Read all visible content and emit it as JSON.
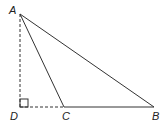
{
  "diagram": {
    "type": "geometry-triangle",
    "points": {
      "A": {
        "label": "A",
        "x": 20,
        "y": 14
      },
      "B": {
        "label": "B",
        "x": 154,
        "y": 107
      },
      "C": {
        "label": "C",
        "x": 64,
        "y": 107
      },
      "D": {
        "label": "D",
        "x": 20,
        "y": 107
      }
    },
    "segments": [
      {
        "from": "A",
        "to": "B",
        "style": "solid"
      },
      {
        "from": "A",
        "to": "C",
        "style": "solid"
      },
      {
        "from": "C",
        "to": "B",
        "style": "solid"
      },
      {
        "from": "A",
        "to": "D",
        "style": "dashed"
      },
      {
        "from": "D",
        "to": "C",
        "style": "dashed"
      }
    ],
    "right_angle_marker": {
      "at": "D"
    },
    "labels": {
      "A": "A",
      "B": "B",
      "C": "C",
      "D": "D"
    },
    "colors": {
      "line": "#333333",
      "label": "#222222",
      "background": "#ffffff"
    }
  }
}
